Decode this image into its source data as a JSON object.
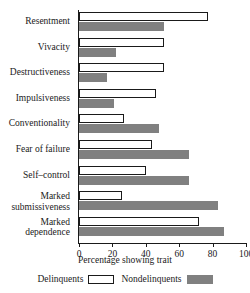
{
  "chart_data": {
    "type": "bar",
    "orientation": "horizontal",
    "title": "",
    "xlabel": "Percentage showing trait",
    "ylabel": "",
    "xlim": [
      0,
      100
    ],
    "xticks": [
      0,
      20,
      40,
      60,
      80,
      100
    ],
    "xtick_labels": [
      "0",
      "20",
      "40",
      "60",
      "80",
      "100"
    ],
    "grid": false,
    "legend_position": "bottom",
    "categories": [
      "Resentment",
      "Vivacity",
      "Destructiveness",
      "Impulsiveness",
      "Conventionality",
      "Fear of failure",
      "Self–control",
      "Marked\nsubmissiveness",
      "Marked\ndependence"
    ],
    "series": [
      {
        "name": "Delinquents",
        "style": "white-filled outlined bar",
        "color": "#ffffff",
        "values": [
          77,
          51,
          51,
          46,
          27,
          44,
          40,
          26,
          72
        ]
      },
      {
        "name": "Nondelinquents",
        "style": "solid gray bar",
        "color": "#808080",
        "values": [
          51,
          22,
          17,
          21,
          48,
          66,
          66,
          83,
          87
        ]
      }
    ]
  },
  "legend": {
    "items": [
      {
        "label": "Delinquents",
        "swatch": "white-outlined-swatch"
      },
      {
        "label": "Nondelinquents",
        "swatch": "gray-filled-swatch"
      }
    ]
  },
  "colors": {
    "bar_nondelinquents": "#808080",
    "bar_delinquents": "#ffffff",
    "axis": "#1a1a1a",
    "text": "#1a1a1a",
    "background": "#ffffff"
  }
}
